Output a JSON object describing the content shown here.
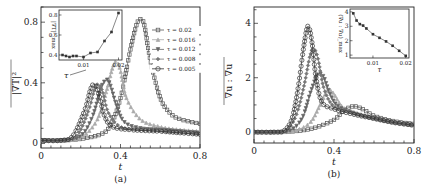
{
  "figure": {
    "panels": [
      {
        "label": "(a)",
        "ylabel": "|∇T|²",
        "xlabel": "t"
      },
      {
        "label": "(b)",
        "ylabel": "∇u : ∇u",
        "xlabel": "t"
      }
    ]
  },
  "chart_data": [
    {
      "type": "line",
      "title": "(a)",
      "xlabel": "t",
      "ylabel": "|∇T|² (mean)",
      "xlim": [
        0,
        0.8
      ],
      "ylim": [
        -0.03,
        0.9
      ],
      "xticks": [
        0,
        0.4,
        0.8
      ],
      "yticks": [
        0,
        0.4,
        0.8
      ],
      "legend_position": "upper right",
      "annotation": "τ (arrow pointing toward decreasing τ peaks)",
      "series": [
        {
          "name": "τ = 0.02",
          "marker": "square",
          "color": "#555555",
          "x": [
            0,
            0.1,
            0.2,
            0.3,
            0.35,
            0.4,
            0.45,
            0.48,
            0.5,
            0.52,
            0.55,
            0.6,
            0.65,
            0.7,
            0.8
          ],
          "y": [
            0.02,
            0.02,
            0.03,
            0.06,
            0.12,
            0.3,
            0.62,
            0.78,
            0.82,
            0.78,
            0.55,
            0.3,
            0.2,
            0.16,
            0.13
          ]
        },
        {
          "name": "τ = 0.016",
          "marker": "triangle-up",
          "color": "#aaaaaa",
          "x": [
            0,
            0.1,
            0.2,
            0.28,
            0.33,
            0.36,
            0.38,
            0.4,
            0.43,
            0.5,
            0.6,
            0.7,
            0.8
          ],
          "y": [
            0.02,
            0.02,
            0.04,
            0.15,
            0.35,
            0.5,
            0.54,
            0.48,
            0.3,
            0.16,
            0.11,
            0.09,
            0.08
          ]
        },
        {
          "name": "τ = 0.012",
          "marker": "triangle-down",
          "color": "#666666",
          "x": [
            0,
            0.1,
            0.2,
            0.26,
            0.3,
            0.33,
            0.35,
            0.38,
            0.42,
            0.5,
            0.6,
            0.7,
            0.8
          ],
          "y": [
            0.02,
            0.02,
            0.05,
            0.18,
            0.36,
            0.42,
            0.38,
            0.25,
            0.14,
            0.1,
            0.09,
            0.08,
            0.07
          ]
        },
        {
          "name": "τ = 0.008",
          "marker": "diamond",
          "color": "#777777",
          "x": [
            0,
            0.1,
            0.18,
            0.24,
            0.27,
            0.29,
            0.31,
            0.34,
            0.4,
            0.5,
            0.6,
            0.7,
            0.8
          ],
          "y": [
            0.02,
            0.02,
            0.05,
            0.22,
            0.36,
            0.39,
            0.34,
            0.2,
            0.11,
            0.09,
            0.08,
            0.07,
            0.06
          ]
        },
        {
          "name": "τ = 0.005",
          "marker": "circle",
          "color": "#333333",
          "x": [
            0,
            0.1,
            0.16,
            0.22,
            0.25,
            0.27,
            0.29,
            0.32,
            0.36,
            0.45,
            0.6,
            0.7,
            0.8
          ],
          "y": [
            0.02,
            0.02,
            0.05,
            0.22,
            0.36,
            0.39,
            0.33,
            0.18,
            0.11,
            0.09,
            0.08,
            0.07,
            0.06
          ]
        }
      ],
      "inset": {
        "type": "line",
        "xlabel": "τ",
        "ylabel": "|∇T|²_max",
        "xticks": [
          0.01,
          0.02
        ],
        "yticks": [
          0.4,
          0.6,
          0.8
        ],
        "xlim": [
          0.003,
          0.021
        ],
        "ylim": [
          0.35,
          0.85
        ],
        "x": [
          0.004,
          0.005,
          0.006,
          0.007,
          0.008,
          0.01,
          0.012,
          0.014,
          0.016,
          0.018,
          0.02
        ],
        "y": [
          0.4,
          0.39,
          0.38,
          0.39,
          0.39,
          0.38,
          0.42,
          0.43,
          0.54,
          0.63,
          0.82
        ]
      }
    },
    {
      "type": "line",
      "title": "(b)",
      "xlabel": "t",
      "ylabel": "∇u : ∇u (mean)",
      "xlim": [
        0,
        0.8
      ],
      "ylim": [
        -0.4,
        4.6
      ],
      "xticks": [
        0,
        0.4,
        0.8
      ],
      "yticks": [
        0,
        2,
        4
      ],
      "series": [
        {
          "name": "τ = 0.02",
          "marker": "square",
          "color": "#555555",
          "x": [
            0,
            0.1,
            0.2,
            0.3,
            0.4,
            0.45,
            0.5,
            0.55,
            0.6,
            0.7,
            0.8
          ],
          "y": [
            0.0,
            0.0,
            0.03,
            0.15,
            0.45,
            0.8,
            0.95,
            0.82,
            0.6,
            0.4,
            0.3
          ]
        },
        {
          "name": "τ = 0.016",
          "marker": "triangle-up",
          "color": "#aaaaaa",
          "x": [
            0,
            0.1,
            0.2,
            0.28,
            0.33,
            0.36,
            0.38,
            0.4,
            0.44,
            0.5,
            0.6,
            0.7,
            0.8
          ],
          "y": [
            0.0,
            0.0,
            0.05,
            0.35,
            1.0,
            1.45,
            1.55,
            1.4,
            0.95,
            0.7,
            0.5,
            0.35,
            0.25
          ]
        },
        {
          "name": "τ = 0.012",
          "marker": "triangle-down",
          "color": "#666666",
          "x": [
            0,
            0.1,
            0.18,
            0.24,
            0.28,
            0.31,
            0.33,
            0.35,
            0.38,
            0.42,
            0.5,
            0.6,
            0.7,
            0.8
          ],
          "y": [
            0.0,
            0.0,
            0.06,
            0.5,
            1.4,
            2.0,
            2.15,
            2.0,
            1.4,
            0.95,
            0.7,
            0.5,
            0.35,
            0.25
          ]
        },
        {
          "name": "τ = 0.008",
          "marker": "diamond",
          "color": "#777777",
          "x": [
            0,
            0.1,
            0.16,
            0.21,
            0.25,
            0.28,
            0.3,
            0.32,
            0.35,
            0.4,
            0.5,
            0.6,
            0.7,
            0.8
          ],
          "y": [
            0.0,
            0.0,
            0.06,
            0.6,
            1.7,
            2.8,
            3.05,
            2.7,
            1.6,
            0.95,
            0.7,
            0.5,
            0.35,
            0.25
          ]
        },
        {
          "name": "τ = 0.005",
          "marker": "circle",
          "color": "#333333",
          "x": [
            0,
            0.1,
            0.15,
            0.19,
            0.22,
            0.25,
            0.27,
            0.29,
            0.31,
            0.34,
            0.4,
            0.5,
            0.6,
            0.7,
            0.8
          ],
          "y": [
            0.0,
            0.0,
            0.05,
            0.5,
            1.6,
            3.2,
            3.9,
            3.3,
            2.0,
            1.1,
            0.85,
            0.65,
            0.5,
            0.35,
            0.25
          ]
        }
      ],
      "inset": {
        "type": "line",
        "xlabel": "τ",
        "ylabel": "(∇u : ∇u)_max",
        "xticks": [
          0.01,
          0.02
        ],
        "yticks": [
          1,
          2,
          3,
          4
        ],
        "xlim": [
          0.003,
          0.021
        ],
        "ylim": [
          0.8,
          4.2
        ],
        "x": [
          0.004,
          0.005,
          0.006,
          0.007,
          0.008,
          0.01,
          0.012,
          0.014,
          0.016,
          0.018,
          0.02
        ],
        "y": [
          3.9,
          3.4,
          3.15,
          3.05,
          2.85,
          2.45,
          2.2,
          1.95,
          1.65,
          1.3,
          0.95
        ]
      }
    }
  ]
}
